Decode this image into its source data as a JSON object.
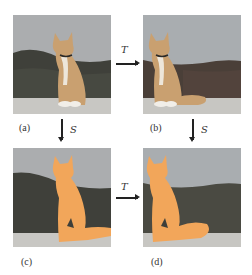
{
  "figure": {
    "panels": [
      {
        "id": "a",
        "label": "(a)",
        "content": "photo of orange kitten sitting, facing left-center",
        "mask": false
      },
      {
        "id": "b",
        "label": "(b)",
        "content": "photo of orange kitten, transformed (shifted left)",
        "mask": false
      },
      {
        "id": "c",
        "label": "(c)",
        "content": "segmentation mask overlay of kitten",
        "mask": true
      },
      {
        "id": "d",
        "label": "(d)",
        "content": "segmentation mask overlay of transformed kitten",
        "mask": true
      }
    ],
    "arrows": {
      "top_transform": "T",
      "bottom_transform": "T",
      "left_segment": "S",
      "right_segment": "S"
    },
    "colors": {
      "mask": "#F2A65A",
      "sky": "#A9ABAD",
      "hills": "#3E3F3A",
      "ground": "#C9C8C4",
      "cat": "#C9A070"
    }
  }
}
